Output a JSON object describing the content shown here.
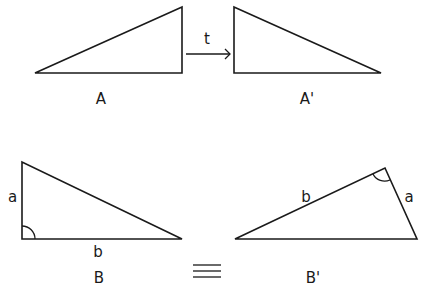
{
  "figures": {
    "A": {
      "label": "A"
    },
    "A_prime": {
      "label": "A'"
    },
    "B": {
      "label": "B",
      "side_a": "a",
      "side_b": "b"
    },
    "B_prime": {
      "label": "B'",
      "side_a": "a",
      "side_b": "b"
    }
  },
  "transform": {
    "label": "t"
  },
  "relation": {
    "symbol": "≡"
  }
}
